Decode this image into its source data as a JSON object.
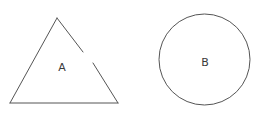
{
  "figure": {
    "title": "Two geometric shapes: an open triangle and a closed circle",
    "canvas": {
      "width": 271,
      "height": 127,
      "background_color": "#ffffff"
    },
    "style": {
      "stroke_color": "#555555",
      "stroke_width": 1,
      "label_color": "#3a3a3a",
      "label_font_size": 11,
      "fill": "none"
    },
    "shapes": [
      {
        "id": "shape-a",
        "kind": "triangle",
        "label": "A",
        "closed": false,
        "note": "right edge is broken by a gap",
        "label_position": {
          "x": 62,
          "y": 68
        },
        "vertices": {
          "apex": {
            "x": 57,
            "y": 18
          },
          "bottom_left": {
            "x": 10,
            "y": 103
          },
          "bottom_right": {
            "x": 118,
            "y": 103
          }
        },
        "gap": {
          "edge": "right",
          "start": {
            "x": 83,
            "y": 52
          },
          "end": {
            "x": 93,
            "y": 63
          }
        },
        "segments": [
          {
            "name": "left-edge",
            "x1": 57,
            "y1": 18,
            "x2": 10,
            "y2": 103
          },
          {
            "name": "bottom-edge",
            "x1": 10,
            "y1": 103,
            "x2": 118,
            "y2": 103
          },
          {
            "name": "right-edge-upper",
            "x1": 57,
            "y1": 18,
            "x2": 83,
            "y2": 52
          },
          {
            "name": "right-edge-lower",
            "x1": 93,
            "y1": 63,
            "x2": 118,
            "y2": 103
          }
        ]
      },
      {
        "id": "shape-b",
        "kind": "circle",
        "label": "B",
        "closed": true,
        "note": "unbroken outline",
        "label_position": {
          "x": 205,
          "y": 63
        },
        "center": {
          "x": 204.5,
          "y": 59.5
        },
        "radius": 45.5,
        "bounds": {
          "left": 159,
          "top": 14,
          "right": 250,
          "bottom": 105
        }
      }
    ]
  }
}
